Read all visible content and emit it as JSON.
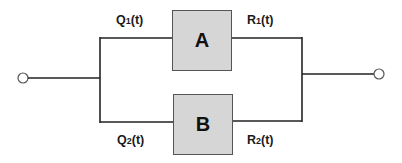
{
  "diagram": {
    "type": "parallel-system-block-diagram",
    "colors": {
      "wire": "#222222",
      "box_fill": "#d6d6d6",
      "box_border": "#555555",
      "terminal": "#555555",
      "text": "#1a1a1a"
    },
    "components": [
      {
        "id": "A",
        "label": "A",
        "input_label": "Q",
        "input_sub": "1",
        "input_suffix": "(t)",
        "output_label": "R",
        "output_sub": "1",
        "output_suffix": "(t)"
      },
      {
        "id": "B",
        "label": "B",
        "input_label": "Q",
        "input_sub": "2",
        "input_suffix": "(t)",
        "output_label": "R",
        "output_sub": "2",
        "output_suffix": "(t)"
      }
    ],
    "terminals": {
      "input": "input-terminal",
      "output": "output-terminal"
    }
  }
}
